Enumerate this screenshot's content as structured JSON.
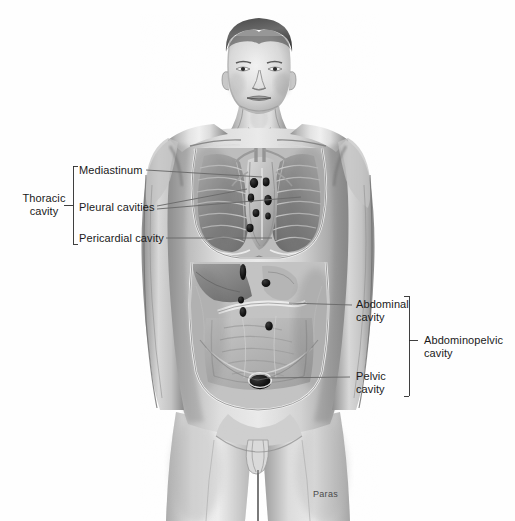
{
  "figure": {
    "background_color": "#ffffff",
    "ink_color": "#1a1a1a",
    "signature": "Paras",
    "top_faint_text": "                                                        "
  },
  "labels": {
    "thoracic_cavity": "Thoracic\ncavity",
    "mediastinum": "Mediastinum",
    "pleural_cavities": "Pleural cavities",
    "pericardial_cavity": "Pericardial cavity",
    "abdominal_cavity": "Abdominal\ncavity",
    "pelvic_cavity": "Pelvic\ncavity",
    "abdominopelvic_cavity": "Abdominopelvic\ncavity"
  },
  "label_positions": {
    "thoracic_cavity": {
      "x": 18,
      "y": 198
    },
    "mediastinum": {
      "x": 79,
      "y": 164
    },
    "pleural_cavities": {
      "x": 79,
      "y": 201
    },
    "pericardial_cavity": {
      "x": 79,
      "y": 232
    },
    "abdominal_cavity": {
      "x": 356,
      "y": 299
    },
    "pelvic_cavity": {
      "x": 356,
      "y": 370
    },
    "abdominopelvic_cavity": {
      "x": 424,
      "y": 334
    },
    "signature": {
      "x": 313,
      "y": 489
    }
  },
  "brackets": {
    "thoracic": {
      "x": 73,
      "top": 166,
      "bottom": 244,
      "tick_y": 205,
      "tick_x": 63
    },
    "abdominopelvic": {
      "x": 409,
      "top": 296,
      "bottom": 396,
      "tick_y": 340,
      "tick_x": 419
    }
  },
  "leaders": [
    {
      "name": "mediastinum-leader",
      "x1": 146,
      "y1": 170,
      "x2": 262,
      "y2": 176
    },
    {
      "name": "pleural-left-leader",
      "x1": 156,
      "y1": 207,
      "x2": 246,
      "y2": 190
    },
    {
      "name": "pleural-right-leader",
      "x1": 156,
      "y1": 209,
      "x2": 300,
      "y2": 196
    },
    {
      "name": "pericardial-leader",
      "x1": 164,
      "y1": 238,
      "x2": 272,
      "y2": 238
    },
    {
      "name": "abdominal-leader",
      "x1": 352,
      "y1": 305,
      "x2": 289,
      "y2": 303
    },
    {
      "name": "pelvic-leader",
      "x1": 350,
      "y1": 376,
      "x2": 266,
      "y2": 377
    }
  ],
  "anatomy": {
    "regions": [
      "head",
      "neck",
      "shoulders",
      "arms",
      "thorax",
      "lungs",
      "ribs",
      "mediastinum",
      "heart",
      "diaphragm",
      "liver",
      "stomach",
      "pancreas",
      "small-intestine",
      "large-intestine",
      "pelvis",
      "groin",
      "thighs"
    ],
    "style": "graphite pencil rendering, grayscale"
  }
}
